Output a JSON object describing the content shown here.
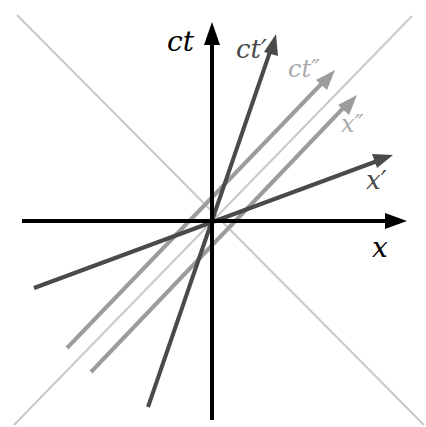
{
  "diagram": {
    "type": "spacetime-minkowski-diagram",
    "origin": [
      212,
      221
    ],
    "colors": {
      "axes": "#000000",
      "primed": "#4a4a4a",
      "double_primed": "#9c9c9c",
      "light_cone": "#c9c9c9",
      "background": "#ffffff"
    },
    "labels": {
      "ct": "ct",
      "ct_prime": "ct′",
      "ct_double_prime": "ct″",
      "x_double_prime": "x″",
      "x_prime": "x′",
      "x": "x"
    },
    "lines": [
      {
        "name": "light-cone-positive",
        "from": [
          14,
          425
        ],
        "to": [
          412,
          16
        ],
        "color": "light_cone",
        "arrow": false
      },
      {
        "name": "light-cone-negative",
        "from": [
          17,
          15
        ],
        "to": [
          424,
          425
        ],
        "color": "light_cone",
        "arrow": false
      },
      {
        "name": "x-axis",
        "from": [
          22,
          221
        ],
        "to": [
          407,
          221
        ],
        "color": "axes",
        "arrow": true
      },
      {
        "name": "ct-axis",
        "from": [
          212,
          420
        ],
        "to": [
          212,
          22
        ],
        "color": "axes",
        "arrow": true
      },
      {
        "name": "ct-prime-axis",
        "from": [
          148,
          407
        ],
        "to": [
          276,
          34
        ],
        "color": "primed",
        "arrow": true
      },
      {
        "name": "x-prime-axis",
        "from": [
          34,
          288
        ],
        "to": [
          393,
          155
        ],
        "color": "primed",
        "arrow": true
      },
      {
        "name": "ct-double-prime-axis",
        "from": [
          67,
          348
        ],
        "to": [
          335,
          70
        ],
        "color": "double_primed",
        "arrow": true
      },
      {
        "name": "x-double-prime-axis",
        "from": [
          91,
          372
        ],
        "to": [
          357,
          95
        ],
        "color": "double_primed",
        "arrow": true
      }
    ]
  }
}
